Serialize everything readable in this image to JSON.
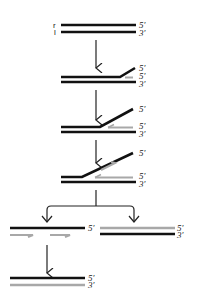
{
  "colors": {
    "template_strand": "#111111",
    "new_strand": "#a8a8a8",
    "arrow": "#222222",
    "label": "#222222",
    "background": "#ffffff"
  },
  "step1": {
    "left_top_label": "r",
    "left_bottom_label": "l",
    "top_end_label": "5′",
    "bottom_end_label": "3′"
  },
  "step2": {
    "labels": [
      "5′",
      "5′",
      "3′"
    ]
  },
  "step3": {
    "labels": [
      "5′",
      "5′",
      "3′"
    ]
  },
  "step4": {
    "labels": [
      "5′",
      "5′",
      "3′"
    ]
  },
  "branch_left": {
    "top_label": "5′"
  },
  "branch_right": {
    "top_label": "5′",
    "bottom_label": "3′"
  },
  "final": {
    "top_label": "5′",
    "bottom_label": "3′"
  }
}
